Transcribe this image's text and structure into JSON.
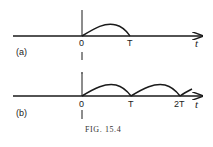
{
  "figure": {
    "caption": "FIG. 15.4",
    "panels": [
      {
        "label": "(a)",
        "origin_label": "0",
        "tick_labels": [
          "T"
        ],
        "axis_label": "t",
        "description": "single arch pulse from 0 to T"
      },
      {
        "label": "(b)",
        "origin_label": "0",
        "tick_labels": [
          "T",
          "2T"
        ],
        "axis_label": "t",
        "description": "repeated arch pulses at 0, T, 2T, ..."
      }
    ],
    "colors": {
      "ink": "#1a1a1a",
      "background": "#ffffff"
    }
  }
}
